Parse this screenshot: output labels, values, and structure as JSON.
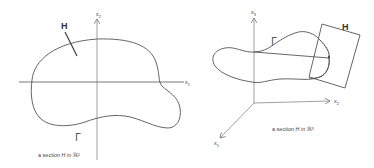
{
  "left_figure": {
    "axis_x_label": "x",
    "axis_x_sub": "1",
    "axis_y_label": "x",
    "axis_y_sub": "2",
    "section_label": "H",
    "curve_label": "Γ",
    "caption": "a section H in ℝ²"
  },
  "right_figure": {
    "axis_x1_label": "x",
    "axis_x1_sub": "1",
    "axis_x2_label": "x",
    "axis_x2_sub": "2",
    "axis_x3_label": "x",
    "axis_x3_sub": "3",
    "section_label": "H",
    "curve_label": "Γ",
    "caption": "a section H in ℝ³"
  },
  "colors": {
    "line": "#555555",
    "axis": "#777777",
    "text": "#444444"
  }
}
